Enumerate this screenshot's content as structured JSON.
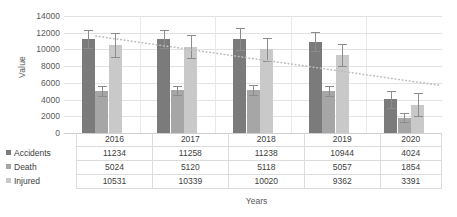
{
  "chart_data": {
    "type": "bar",
    "title": "",
    "xlabel": "Years",
    "ylabel": "Value",
    "categories": [
      "2016",
      "2017",
      "2018",
      "2019",
      "2020"
    ],
    "ylim": [
      0,
      14000
    ],
    "ytick_step": 2000,
    "yticks": [
      "14000",
      "12000",
      "10000",
      "8000",
      "6000",
      "4000",
      "2000",
      "0"
    ],
    "grid": true,
    "legend_position": "table-left",
    "series": [
      {
        "name": "Accidents",
        "color": "#7b7b7b",
        "values": [
          11234,
          11258,
          11238,
          10944,
          4024
        ],
        "errors": [
          1100,
          1050,
          1300,
          1150,
          1050
        ]
      },
      {
        "name": "Death",
        "color": "#a6a6a6",
        "values": [
          5024,
          5120,
          5118,
          5057,
          1854
        ],
        "errors": [
          620,
          560,
          600,
          580,
          560
        ]
      },
      {
        "name": "Injured",
        "color": "#c9c9c9",
        "values": [
          10531,
          10339,
          10020,
          9362,
          3391
        ],
        "errors": [
          1450,
          1350,
          1350,
          1300,
          1400
        ]
      }
    ],
    "trendline": {
      "name": "linear-trend",
      "style": "dotted",
      "color": "#bdbdbd",
      "start_value": 11600,
      "end_value": 5700
    }
  },
  "axis": {
    "y_title": "Value",
    "x_title": "Years"
  },
  "table": {
    "header": [
      "",
      "2016",
      "2017",
      "2018",
      "2019",
      "2020"
    ],
    "rows": [
      {
        "label": "Accidents",
        "marker": "accidents-swatch",
        "color": "#7b7b7b",
        "cells": [
          "11234",
          "11258",
          "11238",
          "10944",
          "4024"
        ]
      },
      {
        "label": "Death",
        "marker": "death-swatch",
        "color": "#a6a6a6",
        "cells": [
          "5024",
          "5120",
          "5118",
          "5057",
          "1854"
        ]
      },
      {
        "label": "Injured",
        "marker": "injured-swatch",
        "color": "#c9c9c9",
        "cells": [
          "10531",
          "10339",
          "10020",
          "9362",
          "3391"
        ]
      }
    ]
  }
}
